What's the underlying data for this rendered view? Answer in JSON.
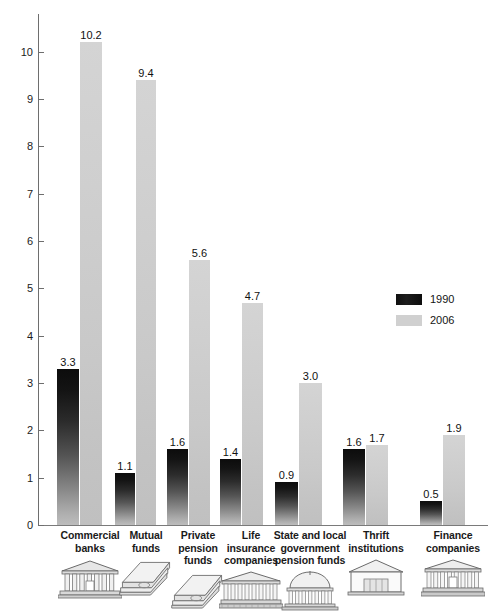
{
  "chart_data": {
    "type": "bar",
    "title": "",
    "subtitle": "",
    "xlabel": "",
    "ylabel": "",
    "ylim": [
      0,
      10.8
    ],
    "grid": false,
    "legend_position": "right",
    "y_ticks": [
      "0",
      "1",
      "2",
      "3",
      "4",
      "5",
      "6",
      "7",
      "8",
      "9",
      "10"
    ],
    "categories": [
      "Commercial\nbanks",
      "Mutual\nfunds",
      "Private\npension\nfunds",
      "Life\ninsurance\ncompanies",
      "State and local\ngovernment\npension funds",
      "Thrift\ninstitutions",
      "Finance\ncompanies"
    ],
    "series": [
      {
        "name": "1990",
        "color": "#151515",
        "values": [
          3.3,
          1.1,
          1.6,
          1.4,
          0.9,
          1.6,
          0.5
        ],
        "labels": [
          "3.3",
          "1.1",
          "1.6",
          "1.4",
          "0.9",
          "1.6",
          "0.5"
        ]
      },
      {
        "name": "2006",
        "color": "#cccccc",
        "values": [
          10.2,
          9.4,
          5.6,
          4.7,
          3.0,
          1.7,
          1.9
        ],
        "labels": [
          "10.2",
          "9.4",
          "5.6",
          "4.7",
          "3.0",
          "1.7",
          "1.9"
        ]
      }
    ],
    "category_icons": [
      "bank-building-icon",
      "stacked-books-icon",
      "stacked-books-icon",
      "classical-building-icon",
      "domed-rotunda-icon",
      "savings-bank-icon",
      "classical-bank-icon"
    ]
  },
  "legend": {
    "items": [
      {
        "label": "1990",
        "swatch": "dark-swatch"
      },
      {
        "label": "2006",
        "swatch": "light-swatch"
      }
    ]
  }
}
